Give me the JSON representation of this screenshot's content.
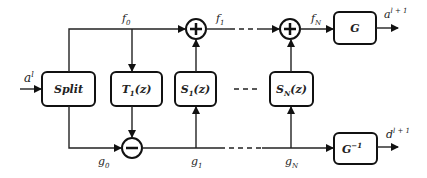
{
  "diagram": {
    "input_label": "a",
    "input_sup": "l",
    "blocks": {
      "split": "Split",
      "t1": "T",
      "t1_sub": "1",
      "t1_arg": "(z)",
      "s1": "S",
      "s1_sub": "1",
      "s1_arg": "(z)",
      "sn": "S",
      "sn_sub": "N",
      "sn_arg": "(z)",
      "g": "G",
      "ginv": "G",
      "ginv_sup": "−1"
    },
    "signals": {
      "f0": "f",
      "f0_sub": "0",
      "f1": "f",
      "f1_sub": "1",
      "fN": "f",
      "fN_sub": "N",
      "g0": "g",
      "g0_sub": "0",
      "g1": "g",
      "g1_sub": "1",
      "gN": "g",
      "gN_sub": "N"
    },
    "outputs": {
      "a_next": "a",
      "a_next_sup": "l + 1",
      "d_next": "d",
      "d_next_sup": "l + 1"
    },
    "operators": {
      "plus": "+",
      "minus": "−"
    }
  }
}
